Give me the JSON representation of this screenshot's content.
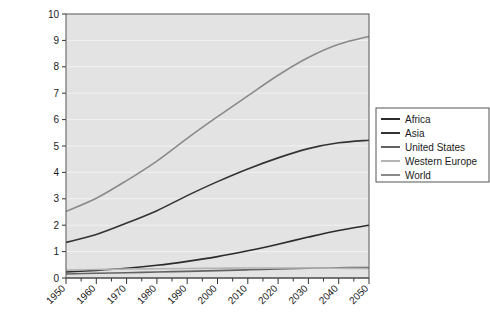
{
  "chart_data": {
    "type": "line",
    "title": "",
    "subtitle": "",
    "xlabel": "",
    "ylabel": "",
    "xlim": [
      1950,
      2050
    ],
    "ylim": [
      0,
      10
    ],
    "yticks": [
      "0",
      "1",
      "2",
      "3",
      "4",
      "5",
      "6",
      "7",
      "8",
      "9",
      "10"
    ],
    "xticks": [
      "1950",
      "1960",
      "1970",
      "1980",
      "1990",
      "2000",
      "2010",
      "2020",
      "2030",
      "2040",
      "2050"
    ],
    "x_minor_tick_step": 5,
    "grid": "horizontal",
    "grid_color": "#f2f2f2",
    "plot_background": "#e3e3e3",
    "legend_position": "right",
    "x": [
      1950,
      1960,
      1970,
      1980,
      1990,
      2000,
      2010,
      2020,
      2030,
      2040,
      2050
    ],
    "series": [
      {
        "name": "Africa",
        "color": "#2b2b2b",
        "values": [
          0.23,
          0.29,
          0.37,
          0.48,
          0.63,
          0.81,
          1.03,
          1.28,
          1.55,
          1.8,
          2.0
        ]
      },
      {
        "name": "Asia",
        "color": "#333333",
        "values": [
          1.35,
          1.65,
          2.08,
          2.55,
          3.12,
          3.65,
          4.13,
          4.55,
          4.9,
          5.12,
          5.22
        ]
      },
      {
        "name": "United States",
        "color": "#636363",
        "values": [
          0.15,
          0.18,
          0.2,
          0.23,
          0.25,
          0.28,
          0.31,
          0.34,
          0.37,
          0.39,
          0.4
        ]
      },
      {
        "name": "Western Europe",
        "color": "#b4b4b4",
        "values": [
          0.3,
          0.32,
          0.34,
          0.35,
          0.36,
          0.37,
          0.38,
          0.38,
          0.38,
          0.37,
          0.36
        ]
      },
      {
        "name": "World",
        "color": "#8a8a8a",
        "values": [
          2.52,
          3.02,
          3.69,
          4.43,
          5.29,
          6.11,
          6.9,
          7.68,
          8.35,
          8.85,
          9.15
        ]
      }
    ]
  },
  "legend": {
    "items": [
      {
        "label": "Africa"
      },
      {
        "label": "Asia"
      },
      {
        "label": "United States"
      },
      {
        "label": "Western Europe"
      },
      {
        "label": "World"
      }
    ]
  }
}
